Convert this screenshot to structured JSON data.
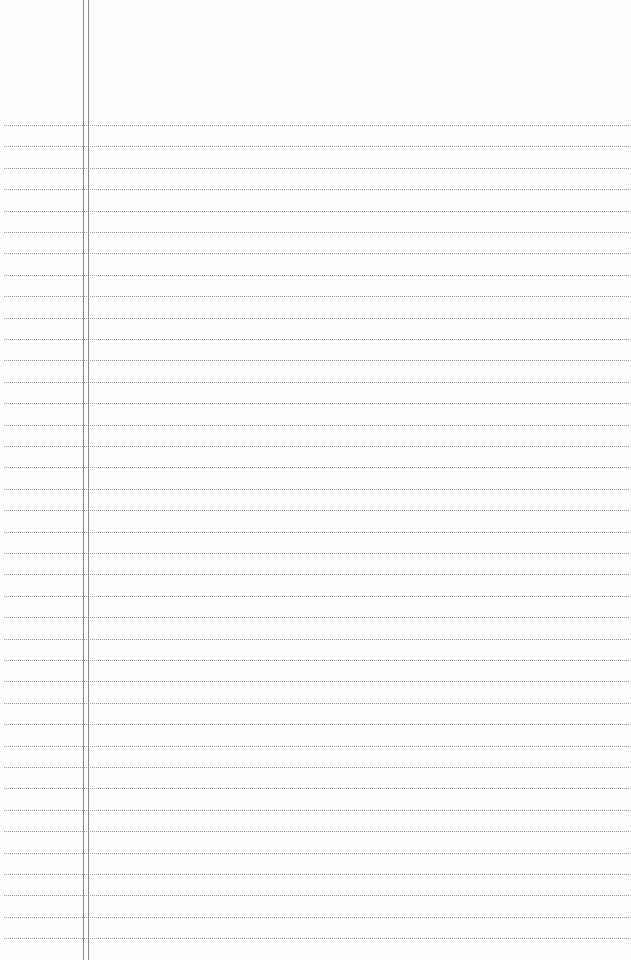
{
  "page": {
    "type": "lined-notepad",
    "background_color": "#fefefe",
    "rule_color": "#9a9a9a",
    "margin_line_color": "#8a8a8a",
    "first_rule_y": 125,
    "rule_spacing": 21.4,
    "rule_count": 39,
    "margin_lines_x": [
      83,
      88
    ],
    "text": ""
  }
}
